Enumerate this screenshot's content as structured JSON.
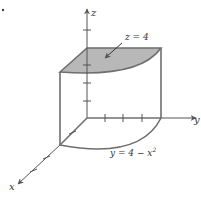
{
  "figure": {
    "colors": {
      "edge": "#6e6e6e",
      "axis": "#555555",
      "top_face_fill": "#b8b8b8",
      "background": "#ffffff"
    },
    "axes": {
      "x_label": "x",
      "y_label": "y",
      "z_label": "z"
    },
    "annotations": {
      "top_surface": "z = 4",
      "base_curve": "y = 4 − x",
      "base_curve_exponent": "2"
    }
  }
}
